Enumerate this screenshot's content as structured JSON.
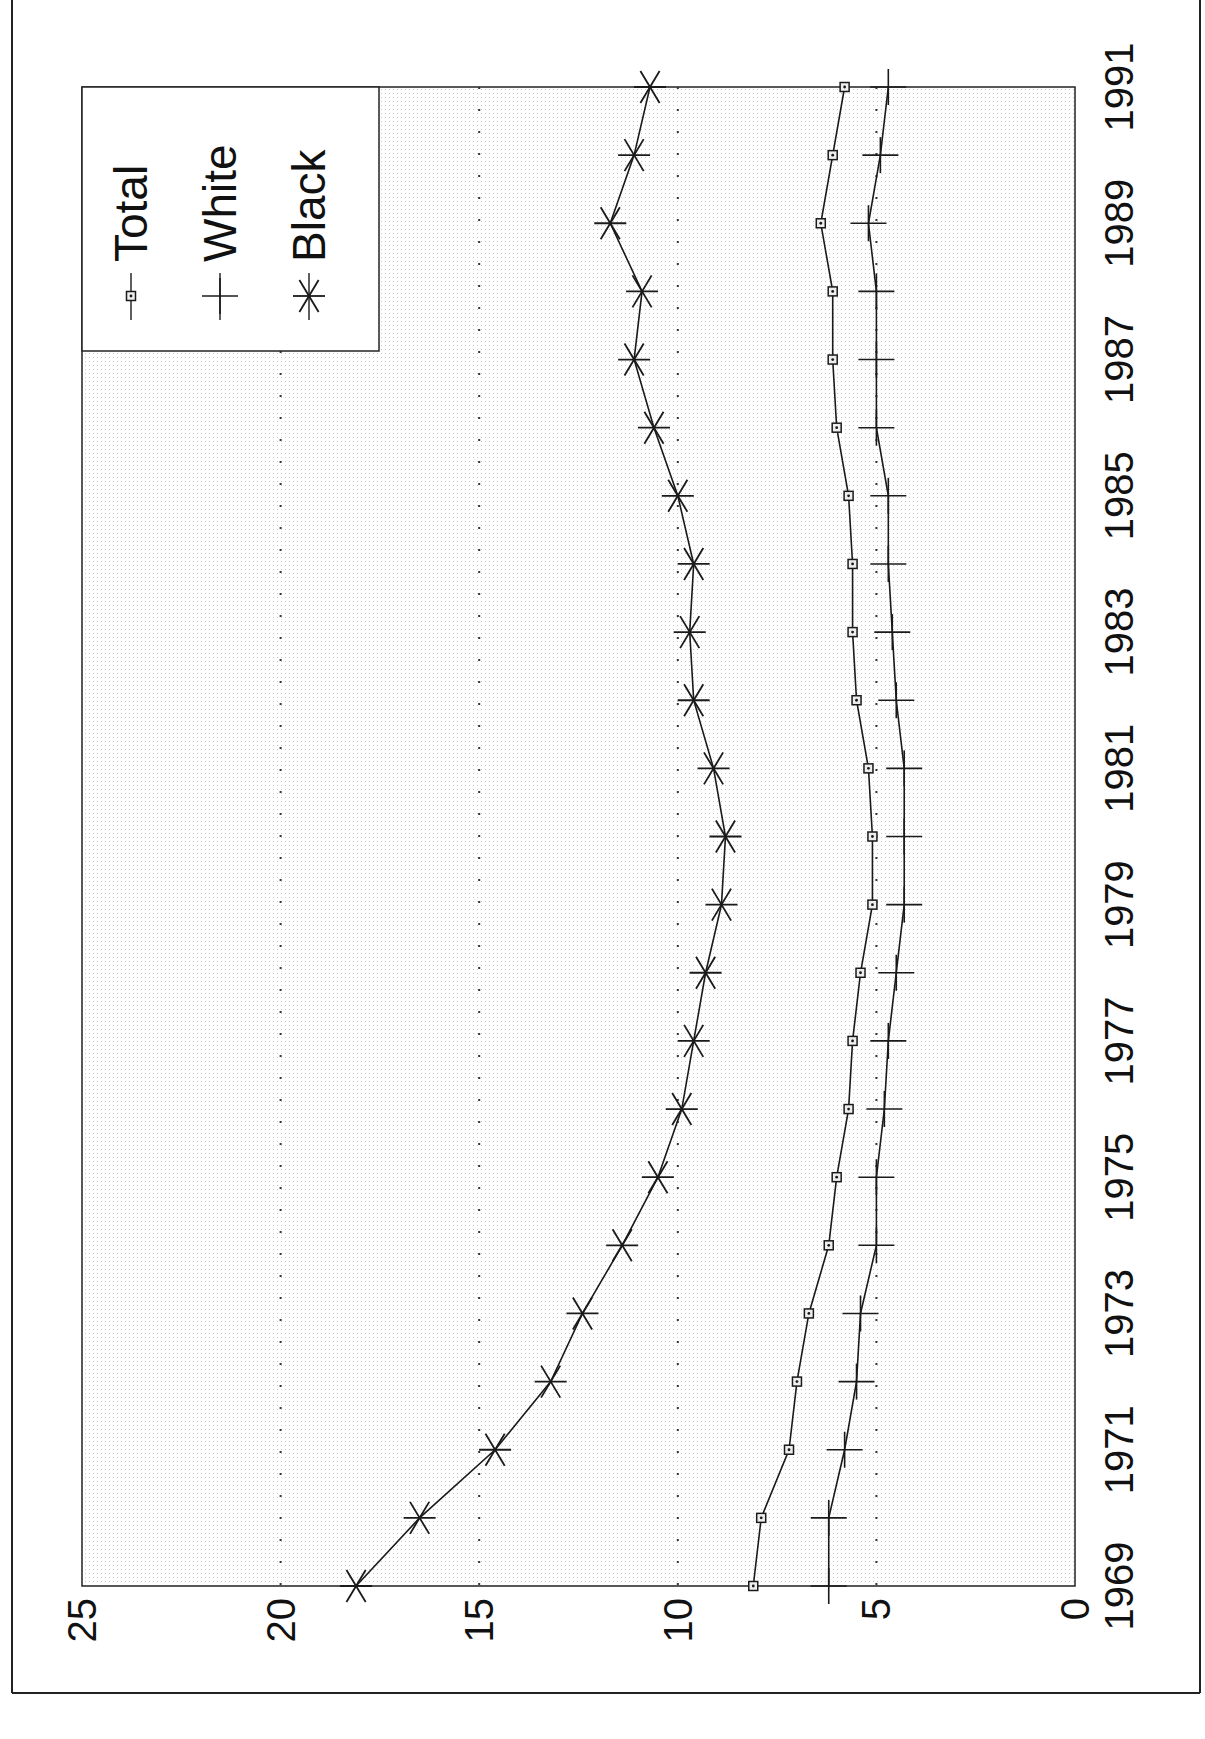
{
  "chart_data": {
    "type": "line",
    "orientation": "rotated-90-ccw",
    "title": "",
    "xlabel": "",
    "ylabel": "",
    "x": [
      1969,
      1970,
      1971,
      1972,
      1973,
      1974,
      1975,
      1976,
      1977,
      1978,
      1979,
      1980,
      1981,
      1982,
      1983,
      1984,
      1985,
      1986,
      1987,
      1988,
      1989,
      1990,
      1991
    ],
    "x_tick_labels": [
      "1969",
      "1971",
      "1973",
      "1975",
      "1977",
      "1979",
      "1981",
      "1983",
      "1985",
      "1987",
      "1989",
      "1991"
    ],
    "y_tick_labels": [
      "0",
      "5",
      "10",
      "15",
      "20",
      "25"
    ],
    "ylim": [
      0,
      25
    ],
    "grid": {
      "y": true,
      "style": "dotted",
      "values": [
        5,
        10,
        15,
        20
      ]
    },
    "legend_position": "upper-left (rotated view: top-left corner)",
    "series": [
      {
        "name": "Total",
        "marker": "square",
        "values": [
          8.1,
          7.9,
          7.2,
          7.0,
          6.7,
          6.2,
          6.0,
          5.7,
          5.6,
          5.4,
          5.1,
          5.1,
          5.2,
          5.5,
          5.6,
          5.6,
          5.7,
          6.0,
          6.1,
          6.1,
          6.4,
          6.1,
          5.8
        ]
      },
      {
        "name": "White",
        "marker": "plus",
        "values": [
          6.2,
          6.2,
          5.8,
          5.5,
          5.4,
          5.0,
          5.0,
          4.8,
          4.7,
          4.5,
          4.3,
          4.3,
          4.3,
          4.5,
          4.6,
          4.7,
          4.7,
          5.0,
          5.0,
          5.0,
          5.2,
          4.9,
          4.7
        ]
      },
      {
        "name": "Black",
        "marker": "asterisk",
        "values": [
          18.1,
          16.5,
          14.6,
          13.2,
          12.4,
          11.4,
          10.5,
          9.9,
          9.6,
          9.3,
          8.9,
          8.8,
          9.1,
          9.6,
          9.7,
          9.6,
          10.0,
          10.6,
          11.1,
          10.9,
          11.7,
          11.1,
          10.7
        ]
      }
    ]
  },
  "legend": {
    "items": [
      {
        "label": "Total",
        "icon": "square-marker-icon"
      },
      {
        "label": "White",
        "icon": "plus-marker-icon"
      },
      {
        "label": "Black",
        "icon": "asterisk-marker-icon"
      }
    ]
  },
  "colors": {
    "line": "#1a1a1a",
    "plot_bg": "#f1f1f1",
    "frame": "#222222",
    "grid": "#333333"
  }
}
